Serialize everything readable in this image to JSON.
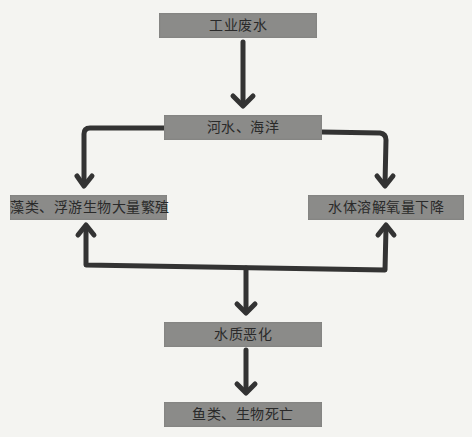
{
  "diagram": {
    "type": "flowchart",
    "colors": {
      "box_fill": "#8b8b89",
      "text": "#2a2a2a",
      "arrow": "#333333",
      "background": "#f4f4f1"
    },
    "nodes": [
      {
        "id": "industrial-wastewater",
        "label": "工业废水"
      },
      {
        "id": "rivers-oceans",
        "label": "河水、海洋"
      },
      {
        "id": "algae-bloom",
        "label": "藻类、浮游生物大量繁殖"
      },
      {
        "id": "oxygen-decline",
        "label": "水体溶解氧量下降"
      },
      {
        "id": "water-deterioration",
        "label": "水质恶化"
      },
      {
        "id": "fish-death",
        "label": "鱼类、生物死亡"
      }
    ],
    "edges": [
      {
        "from": "industrial-wastewater",
        "to": "rivers-oceans"
      },
      {
        "from": "rivers-oceans",
        "to": "algae-bloom"
      },
      {
        "from": "rivers-oceans",
        "to": "oxygen-decline"
      },
      {
        "from": "water-deterioration",
        "to": "algae-bloom"
      },
      {
        "from": "water-deterioration",
        "to": "oxygen-decline"
      },
      {
        "from": "water-deterioration",
        "to": "fish-death"
      }
    ]
  }
}
